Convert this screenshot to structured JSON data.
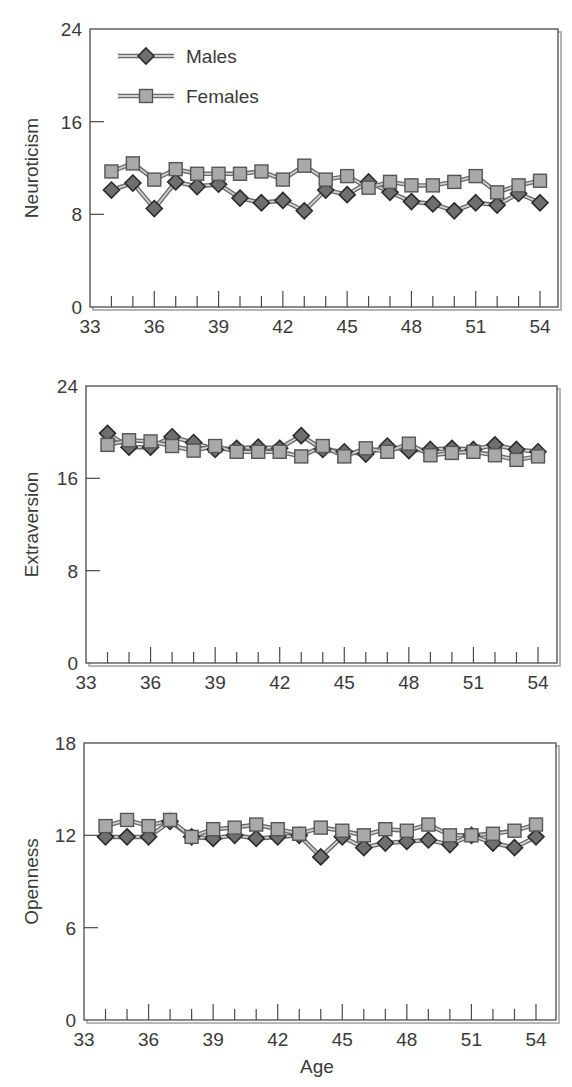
{
  "colors": {
    "male_marker_fill": "#6f6f6f",
    "male_marker_stroke": "#2b2b2b",
    "female_marker_fill": "#a9a9a9",
    "female_marker_stroke": "#555555",
    "line": "#8c8c8c",
    "line_highlight": "#d0d0d0",
    "frame": "#4a4a4a",
    "frame_shadow": "#b5b5b5"
  },
  "legend": {
    "males": "Males",
    "females": "Females"
  },
  "chart_data": [
    {
      "type": "line",
      "title": "",
      "xlabel": "",
      "ylabel": "Neuroticism",
      "x": [
        34,
        35,
        36,
        37,
        38,
        39,
        40,
        41,
        42,
        43,
        44,
        45,
        46,
        47,
        48,
        49,
        50,
        51,
        52,
        53,
        54
      ],
      "xlim": [
        33,
        54
      ],
      "ylim": [
        0,
        24
      ],
      "yticks": [
        0,
        8,
        16,
        24
      ],
      "xticks": [
        33,
        36,
        39,
        42,
        45,
        48,
        51,
        54
      ],
      "grid": false,
      "legend_position": "upper left",
      "series": [
        {
          "name": "Males",
          "marker": "diamond",
          "values": [
            10.1,
            10.7,
            8.5,
            10.8,
            10.4,
            10.6,
            9.4,
            9.0,
            9.2,
            8.3,
            10.1,
            9.7,
            10.8,
            9.9,
            9.1,
            8.9,
            8.3,
            9.0,
            8.8,
            9.8,
            9.0
          ]
        },
        {
          "name": "Females",
          "marker": "square",
          "values": [
            11.7,
            12.4,
            11.0,
            11.9,
            11.5,
            11.5,
            11.5,
            11.7,
            11.0,
            12.2,
            11.0,
            11.3,
            10.3,
            10.8,
            10.5,
            10.5,
            10.8,
            11.3,
            9.9,
            10.5,
            10.9
          ]
        }
      ]
    },
    {
      "type": "line",
      "title": "",
      "xlabel": "",
      "ylabel": "Extraversion",
      "x": [
        34,
        35,
        36,
        37,
        38,
        39,
        40,
        41,
        42,
        43,
        44,
        45,
        46,
        47,
        48,
        49,
        50,
        51,
        52,
        53,
        54
      ],
      "xlim": [
        33,
        54
      ],
      "ylim": [
        0,
        24
      ],
      "yticks": [
        0,
        8,
        16,
        24
      ],
      "xticks": [
        33,
        36,
        39,
        42,
        45,
        48,
        51,
        54
      ],
      "grid": false,
      "series": [
        {
          "name": "Males",
          "marker": "diamond",
          "values": [
            19.9,
            18.7,
            18.7,
            19.6,
            19.1,
            18.5,
            18.6,
            18.7,
            18.6,
            19.7,
            18.5,
            18.3,
            18.1,
            18.8,
            18.4,
            18.5,
            18.6,
            18.5,
            18.9,
            18.5,
            18.3
          ]
        },
        {
          "name": "Females",
          "marker": "square",
          "values": [
            18.9,
            19.3,
            19.2,
            18.8,
            18.4,
            18.8,
            18.3,
            18.3,
            18.3,
            17.9,
            18.8,
            17.9,
            18.6,
            18.3,
            19.0,
            18.0,
            18.2,
            18.3,
            18.0,
            17.6,
            17.9
          ]
        }
      ]
    },
    {
      "type": "line",
      "title": "",
      "xlabel": "Age",
      "ylabel": "Openness",
      "x": [
        34,
        35,
        36,
        37,
        38,
        39,
        40,
        41,
        42,
        43,
        44,
        45,
        46,
        47,
        48,
        49,
        50,
        51,
        52,
        53,
        54
      ],
      "xlim": [
        33,
        54
      ],
      "ylim": [
        0,
        18
      ],
      "yticks": [
        0,
        6,
        12,
        18
      ],
      "xticks": [
        33,
        36,
        39,
        42,
        45,
        48,
        51,
        54
      ],
      "grid": false,
      "series": [
        {
          "name": "Males",
          "marker": "diamond",
          "values": [
            11.9,
            11.9,
            11.9,
            12.9,
            11.9,
            11.8,
            12.0,
            11.8,
            11.9,
            12.0,
            10.6,
            11.9,
            11.2,
            11.5,
            11.6,
            11.7,
            11.4,
            12.0,
            11.5,
            11.2,
            11.9
          ]
        },
        {
          "name": "Females",
          "marker": "square",
          "values": [
            12.6,
            13.0,
            12.6,
            13.0,
            11.9,
            12.4,
            12.5,
            12.7,
            12.4,
            12.1,
            12.5,
            12.3,
            12.0,
            12.4,
            12.3,
            12.7,
            12.0,
            12.0,
            12.1,
            12.3,
            12.7
          ]
        }
      ]
    }
  ]
}
